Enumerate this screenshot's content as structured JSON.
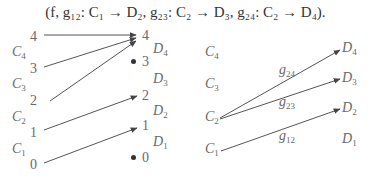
{
  "formula": {
    "text": "(f, g₁₂: C₁ → D₂, g₂₃: C₂ → D₃, g₂₄: C₂ → D₄)."
  },
  "left_diagram": {
    "source_numbers": [
      {
        "label": "4",
        "x": 30,
        "y": 30
      },
      {
        "label": "3",
        "x": 30,
        "y": 62
      },
      {
        "label": "2",
        "x": 30,
        "y": 94
      },
      {
        "label": "1",
        "x": 30,
        "y": 126
      },
      {
        "label": "0",
        "x": 30,
        "y": 158
      }
    ],
    "source_sets": [
      {
        "name": "C",
        "sub": "4",
        "x": 12,
        "y": 45
      },
      {
        "name": "C",
        "sub": "3",
        "x": 12,
        "y": 77
      },
      {
        "name": "C",
        "sub": "2",
        "x": 12,
        "y": 110
      },
      {
        "name": "C",
        "sub": "1",
        "x": 12,
        "y": 142
      }
    ],
    "target_numbers": [
      {
        "label": "4",
        "x": 142,
        "y": 29,
        "dot": false
      },
      {
        "label": "3",
        "x": 142,
        "y": 55,
        "dot": true
      },
      {
        "label": "2",
        "x": 142,
        "y": 89,
        "dot": false
      },
      {
        "label": "1",
        "x": 142,
        "y": 119,
        "dot": false
      },
      {
        "label": "0",
        "x": 142,
        "y": 151,
        "dot": true
      }
    ],
    "target_sets": [
      {
        "name": "D",
        "sub": "4",
        "x": 153,
        "y": 42
      },
      {
        "name": "D",
        "sub": "3",
        "x": 153,
        "y": 72
      },
      {
        "name": "D",
        "sub": "2",
        "x": 153,
        "y": 104
      },
      {
        "name": "D",
        "sub": "1",
        "x": 153,
        "y": 135
      }
    ],
    "arrows": [
      {
        "from": "4",
        "to": "4",
        "x1": 44,
        "y1": 35,
        "x2": 136,
        "y2": 35
      },
      {
        "from": "3",
        "to": "4",
        "x1": 44,
        "y1": 67,
        "x2": 136,
        "y2": 38
      },
      {
        "from": "2",
        "to": "4",
        "x1": 50,
        "y1": 101,
        "x2": 136,
        "y2": 41
      },
      {
        "from": "1",
        "to": "2",
        "x1": 44,
        "y1": 130,
        "x2": 137,
        "y2": 96
      },
      {
        "from": "0",
        "to": "1",
        "x1": 44,
        "y1": 163,
        "x2": 137,
        "y2": 128
      }
    ]
  },
  "right_diagram": {
    "source_sets": [
      {
        "name": "C",
        "sub": "4",
        "x": 205,
        "y": 45
      },
      {
        "name": "C",
        "sub": "3",
        "x": 205,
        "y": 77
      },
      {
        "name": "C",
        "sub": "2",
        "x": 205,
        "y": 110
      },
      {
        "name": "C",
        "sub": "1",
        "x": 205,
        "y": 142
      }
    ],
    "target_sets": [
      {
        "name": "D",
        "sub": "4",
        "x": 342,
        "y": 41
      },
      {
        "name": "D",
        "sub": "3",
        "x": 342,
        "y": 71
      },
      {
        "name": "D",
        "sub": "2",
        "x": 342,
        "y": 101
      },
      {
        "name": "D",
        "sub": "1",
        "x": 342,
        "y": 132
      }
    ],
    "maps": [
      {
        "name": "g",
        "sub": "24",
        "label_x": 279,
        "label_y": 63,
        "x1": 220,
        "y1": 118,
        "x2": 340,
        "y2": 50
      },
      {
        "name": "g",
        "sub": "23",
        "label_x": 279,
        "label_y": 95,
        "x1": 220,
        "y1": 119,
        "x2": 340,
        "y2": 79
      },
      {
        "name": "g",
        "sub": "12",
        "label_x": 279,
        "label_y": 129,
        "x1": 221,
        "y1": 151,
        "x2": 340,
        "y2": 109
      }
    ]
  },
  "colors": {
    "arrow": "#444444",
    "label": "#6a6a6a",
    "formula": "#333333"
  }
}
